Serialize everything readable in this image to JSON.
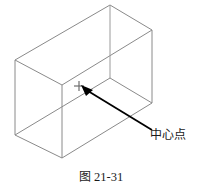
{
  "figure": {
    "caption_prefix": "图",
    "caption_number": "21-31",
    "caption_full": "图 21-31"
  },
  "annotation": {
    "label": "中心点",
    "marker_glyph": "+",
    "marker_name": "center-point-crosshair"
  },
  "colors": {
    "background": "#ffffff",
    "wireframe_stroke": "#8a8a8a",
    "wireframe_stroke_dark": "#707070",
    "leader_line": "#000000",
    "text": "#1a1a1a"
  },
  "diagram": {
    "type": "isometric-wireframe-box",
    "vertices": {
      "back_top": [
        110,
        5
      ],
      "left_top": [
        15,
        60
      ],
      "right_top": [
        152,
        30
      ],
      "front_top": [
        62,
        85
      ],
      "left_bottom": [
        15,
        135
      ],
      "front_bottom": [
        62,
        158
      ],
      "right_bottom": [
        152,
        103
      ]
    },
    "center_marker_point": [
      79,
      86
    ],
    "leader_from": [
      152,
      130
    ],
    "leader_to": [
      82,
      87
    ]
  }
}
